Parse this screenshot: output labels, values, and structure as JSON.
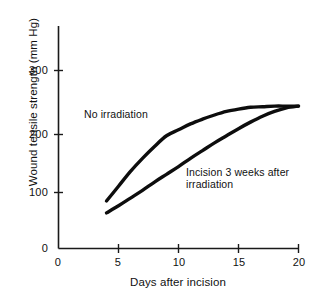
{
  "chart_data": {
    "type": "line",
    "title": "",
    "xlabel": "Days after incision",
    "ylabel": "Wound tensile strength (mm Hg)",
    "xlim": [
      0,
      20
    ],
    "ylim": [
      0,
      300
    ],
    "xticks": [
      "0",
      "5",
      "10",
      "15",
      "20"
    ],
    "yticks": [
      "0",
      "100",
      "200",
      "300"
    ],
    "grid": false,
    "legend_position": "inline-annotation",
    "series": [
      {
        "name": "No irradiation",
        "x": [
          4,
          5,
          6,
          7,
          8,
          9,
          10,
          11,
          12,
          13,
          14,
          15,
          16,
          17,
          18,
          19,
          20
        ],
        "values": [
          80,
          105,
          130,
          152,
          172,
          190,
          200,
          210,
          218,
          225,
          231,
          235,
          238,
          239,
          240,
          240,
          240
        ]
      },
      {
        "name": "Incision 3 weeks after irradiation",
        "x": [
          4,
          5,
          6,
          7,
          8,
          9,
          10,
          11,
          12,
          13,
          14,
          15,
          16,
          17,
          18,
          19,
          20
        ],
        "values": [
          60,
          72,
          85,
          98,
          112,
          125,
          138,
          152,
          165,
          178,
          190,
          202,
          213,
          223,
          231,
          237,
          240
        ]
      }
    ],
    "annotations": [
      {
        "text": "No irradiation",
        "x": 4.5,
        "y": 238
      },
      {
        "text": "Incision 3 weeks after",
        "x": 12.7,
        "y": 140
      },
      {
        "text": "irradiation",
        "x": 12.7,
        "y": 122
      }
    ]
  },
  "axes": {
    "y_tick_0": "0",
    "y_tick_100": "100",
    "y_tick_200": "200",
    "y_tick_300": "300",
    "x_tick_0": "0",
    "x_tick_5": "5",
    "x_tick_10": "10",
    "x_tick_15": "15",
    "x_tick_20": "20",
    "x_title": "Days after incision",
    "y_title": "Wound tensile strength (mm Hg)"
  },
  "labels": {
    "no_irradiation": "No irradiation",
    "incision_line1": "Incision 3 weeks after",
    "incision_line2": "irradiation"
  },
  "colors": {
    "curve": "#0d0d0d",
    "axis": "#1a1a1a",
    "text": "#111111",
    "background": "#ffffff"
  }
}
